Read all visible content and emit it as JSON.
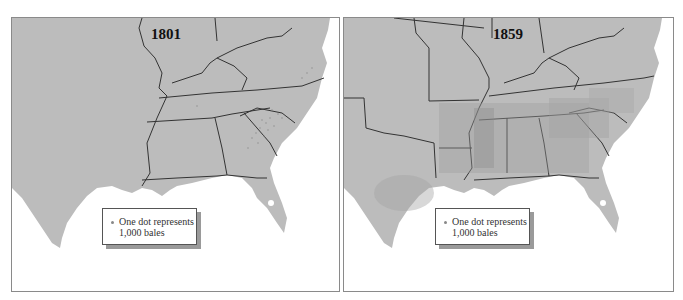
{
  "colors": {
    "land": "#bcbcbc",
    "water": "#ffffff",
    "dots": "#8c8c8c",
    "borders": "#333333"
  },
  "maps": [
    {
      "year": "1801",
      "legend": {
        "line1": "One dot represents",
        "line2": "1,000 bales"
      }
    },
    {
      "year": "1859",
      "legend": {
        "line1": "One dot represents",
        "line2": "1,000 bales"
      }
    }
  ]
}
